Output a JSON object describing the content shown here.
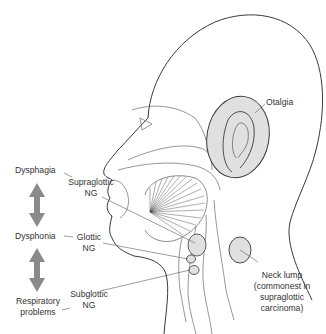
{
  "diagram": {
    "colors": {
      "line": "#3a3a3a",
      "fill_highlight": "#e0e0e0",
      "arrow": "#8a8a8a",
      "text": "#333333"
    },
    "labels": {
      "otalgia": "Otalgia",
      "dysphagia": "Dysphagia",
      "dysphonia": "Dysphonia",
      "respiratory_1": "Respiratory",
      "respiratory_2": "problems",
      "supraglottic_1": "Supraglottic",
      "supraglottic_2": "NG",
      "glottic_1": "Glottic",
      "glottic_2": "NG",
      "subglottic_1": "Subglottic",
      "subglottic_2": "NG",
      "neck_lump_1": "Neck lump",
      "neck_lump_2": "(commonest in",
      "neck_lump_3": "supraglottic",
      "neck_lump_4": "carcinoma)"
    },
    "arrows": [
      {
        "from": "Dysphagia",
        "to": "Dysphonia",
        "type": "double-headed"
      },
      {
        "from": "Dysphonia",
        "to": "Respiratory problems",
        "type": "double-headed"
      }
    ]
  }
}
